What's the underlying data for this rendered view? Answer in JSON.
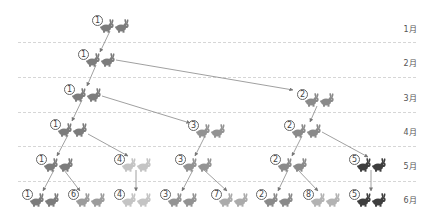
{
  "months": [
    {
      "label": "1月",
      "y": 28
    },
    {
      "label": "2月",
      "y": 62
    },
    {
      "label": "3月",
      "y": 97
    },
    {
      "label": "4月",
      "y": 131
    },
    {
      "label": "5月",
      "y": 165
    },
    {
      "label": "6月",
      "y": 199
    }
  ],
  "separators_y": [
    42,
    77,
    112,
    146,
    181
  ],
  "pair_colors": {
    "1": "#7c7c7c",
    "2": "#8a8a8a",
    "3": "#939393",
    "4": "#c4c4c4",
    "5": "#3e3e3e",
    "6": "#9c9c9c",
    "7": "#ababab",
    "8": "#b3b3b3"
  },
  "pairs": [
    {
      "id": "1",
      "label": "①",
      "month": 1,
      "x": 100,
      "y": 18
    },
    {
      "id": "1",
      "label": "①",
      "month": 2,
      "x": 86,
      "y": 52
    },
    {
      "id": "1",
      "label": "①",
      "month": 3,
      "x": 72,
      "y": 87
    },
    {
      "id": "2",
      "label": "②",
      "month": 3,
      "x": 305,
      "y": 92
    },
    {
      "id": "1",
      "label": "①",
      "month": 4,
      "x": 58,
      "y": 122
    },
    {
      "id": "3",
      "label": "③",
      "month": 4,
      "x": 196,
      "y": 123
    },
    {
      "id": "2",
      "label": "②",
      "month": 4,
      "x": 292,
      "y": 123
    },
    {
      "id": "1",
      "label": "①",
      "month": 5,
      "x": 44,
      "y": 157
    },
    {
      "id": "4",
      "label": "④",
      "month": 5,
      "x": 122,
      "y": 157
    },
    {
      "id": "3",
      "label": "③",
      "month": 5,
      "x": 183,
      "y": 157
    },
    {
      "id": "2",
      "label": "②",
      "month": 5,
      "x": 278,
      "y": 157
    },
    {
      "id": "5",
      "label": "⑤",
      "month": 5,
      "x": 357,
      "y": 157
    },
    {
      "id": "1",
      "label": "①",
      "month": 6,
      "x": 30,
      "y": 192
    },
    {
      "id": "6",
      "label": "⑥",
      "month": 6,
      "x": 76,
      "y": 192
    },
    {
      "id": "4",
      "label": "④",
      "month": 6,
      "x": 122,
      "y": 192
    },
    {
      "id": "3",
      "label": "③",
      "month": 6,
      "x": 168,
      "y": 192
    },
    {
      "id": "7",
      "label": "⑦",
      "month": 6,
      "x": 219,
      "y": 192
    },
    {
      "id": "2",
      "label": "②",
      "month": 6,
      "x": 264,
      "y": 192
    },
    {
      "id": "8",
      "label": "⑧",
      "month": 6,
      "x": 311,
      "y": 192
    },
    {
      "id": "5",
      "label": "⑤",
      "month": 6,
      "x": 357,
      "y": 192
    }
  ],
  "arrows": [
    [
      110,
      31,
      100,
      52
    ],
    [
      96,
      65,
      87,
      86
    ],
    [
      116,
      60,
      293,
      90
    ],
    [
      82,
      100,
      72,
      121
    ],
    [
      102,
      96,
      190,
      123
    ],
    [
      317,
      106,
      310,
      122
    ],
    [
      68,
      135,
      57,
      156
    ],
    [
      88,
      134,
      128,
      156
    ],
    [
      205,
      136,
      195,
      156
    ],
    [
      302,
      136,
      292,
      156
    ],
    [
      322,
      132,
      368,
      157
    ],
    [
      54,
      170,
      43,
      191
    ],
    [
      64,
      170,
      80,
      191
    ],
    [
      136,
      170,
      136,
      191
    ],
    [
      193,
      170,
      182,
      191
    ],
    [
      204,
      170,
      227,
      191
    ],
    [
      288,
      170,
      278,
      191
    ],
    [
      298,
      170,
      318,
      191
    ],
    [
      371,
      170,
      371,
      191
    ]
  ]
}
